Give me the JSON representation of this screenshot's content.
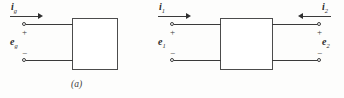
{
  "figure": {
    "type": "circuit-diagram",
    "background_color": "#fdfdfc",
    "line_color": "#3a3a3a",
    "text_color": "#2b2b2b"
  },
  "panel_a": {
    "caption": "(a)",
    "box_label": "",
    "current": {
      "symbol": "i",
      "subscript": "g",
      "arrow_direction": "right"
    },
    "voltage": {
      "symbol": "e",
      "subscript": "g",
      "plus": "+",
      "minus": "−"
    },
    "terminals": 2
  },
  "panel_b": {
    "caption": "(b)",
    "box_label": "",
    "left_port": {
      "current": {
        "symbol": "i",
        "subscript": "1",
        "arrow_direction": "right"
      },
      "voltage": {
        "symbol": "e",
        "subscript": "1",
        "plus": "+",
        "minus": "−"
      }
    },
    "right_port": {
      "current": {
        "symbol": "i",
        "subscript": "2",
        "arrow_direction": "left"
      },
      "voltage": {
        "symbol": "e",
        "subscript": "2",
        "plus": "+",
        "minus": "−"
      }
    },
    "terminals": 4
  }
}
